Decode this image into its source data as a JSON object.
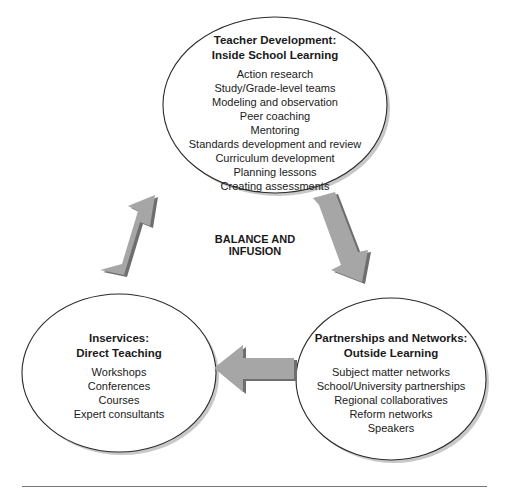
{
  "diagram": {
    "center_label": "BALANCE AND INFUSION",
    "nodes": {
      "teacher_development": {
        "title_line1": "Teacher Development:",
        "title_line2": "Inside School Learning",
        "items": [
          "Action research",
          "Study/Grade-level teams",
          "Modeling and observation",
          "Peer coaching",
          "Mentoring",
          "Standards development and review",
          "Curriculum development",
          "Planning lessons",
          "Creating assessments"
        ]
      },
      "inservices": {
        "title_line1": "Inservices:",
        "title_line2": "Direct Teaching",
        "items": [
          "Workshops",
          "Conferences",
          "Courses",
          "Expert consultants"
        ]
      },
      "partnerships": {
        "title_line1": "Partnerships and Networks:",
        "title_line2": "Outside Learning",
        "items": [
          "Subject matter networks",
          "School/University partnerships",
          "Regional collaboratives",
          "Reform networks",
          "Speakers"
        ]
      }
    },
    "arrows": [
      {
        "from": "inservices",
        "to": "teacher_development",
        "direction": "up-right"
      },
      {
        "from": "teacher_development",
        "to": "partnerships",
        "direction": "down-right"
      },
      {
        "from": "partnerships",
        "to": "inservices",
        "direction": "left"
      }
    ],
    "colors": {
      "arrow_fill": "#a6a6a6",
      "arrow_shadow": "#6e6e6e",
      "ellipse_stroke": "#2a2a2a",
      "ellipse_shadow": "#9a9a9a"
    }
  }
}
